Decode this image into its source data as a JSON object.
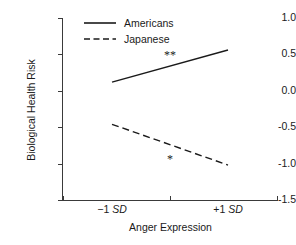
{
  "chart_data": {
    "type": "line",
    "title": "",
    "xlabel": "Anger Expression",
    "ylabel": "Biological Health Risk",
    "x": [
      "-1 SD",
      "+1 SD"
    ],
    "xtick_labels": [
      "−1 SD",
      "+1 SD"
    ],
    "ytick_labels": [
      "1.0",
      "0.5",
      "0.0",
      "-0.5",
      "-1.0",
      "-1.5"
    ],
    "ytick_values": [
      1.0,
      0.5,
      0.0,
      -0.5,
      -1.0,
      -1.5
    ],
    "ylim": [
      -1.5,
      1.0
    ],
    "xlim": [
      -1.55,
      1.55
    ],
    "grid": false,
    "legend_position": "top-center",
    "series": [
      {
        "name": "Americans",
        "style": "solid",
        "color": "#1a1a1a",
        "values": [
          0.12,
          0.56
        ]
      },
      {
        "name": "Japanese",
        "style": "dashed",
        "color": "#1a1a1a",
        "values": [
          -0.46,
          -1.02
        ]
      }
    ],
    "annotations": [
      {
        "text": "**",
        "x": 0.0,
        "y": 0.49,
        "series": "Americans"
      },
      {
        "text": "*",
        "x": 0.0,
        "y": -0.93,
        "series": "Japanese"
      }
    ]
  },
  "axes": {
    "y_title": "Biological Health Risk",
    "x_title": "Anger Expression",
    "y_ticks": [
      {
        "label": "1.0",
        "value": 1.0
      },
      {
        "label": "0.5",
        "value": 0.5
      },
      {
        "label": "0.0",
        "value": 0.0
      },
      {
        "label": "-0.5",
        "value": -0.5
      },
      {
        "label": "-1.0",
        "value": -1.0
      },
      {
        "label": "-1.5",
        "value": -1.5
      }
    ],
    "x_ticks": [
      {
        "prefix": "−1 ",
        "em": "SD",
        "value": -1
      },
      {
        "prefix": "+1 ",
        "em": "SD",
        "value": 1
      }
    ]
  },
  "legend": {
    "items": [
      {
        "label": "Americans",
        "style": "solid"
      },
      {
        "label": "Japanese",
        "style": "dashed"
      }
    ]
  }
}
